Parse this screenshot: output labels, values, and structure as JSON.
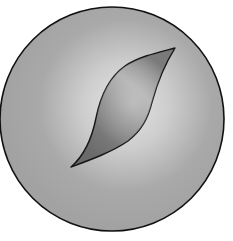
{
  "illustration": {
    "description": "grey sphere with leaf-shaped opening",
    "background": "#ffffff",
    "sphere": {
      "cx": 112,
      "cy": 119,
      "r": 112,
      "fill": "#a5a5a5",
      "highlight": "#e2e2e2",
      "stroke": "#111111"
    },
    "opening": {
      "tip_top": [
        175,
        48
      ],
      "tip_bottom": [
        71,
        167
      ],
      "fill_dark": "#6e6e6e",
      "fill_light": "#b4b4b4",
      "stroke": "#151515"
    }
  }
}
